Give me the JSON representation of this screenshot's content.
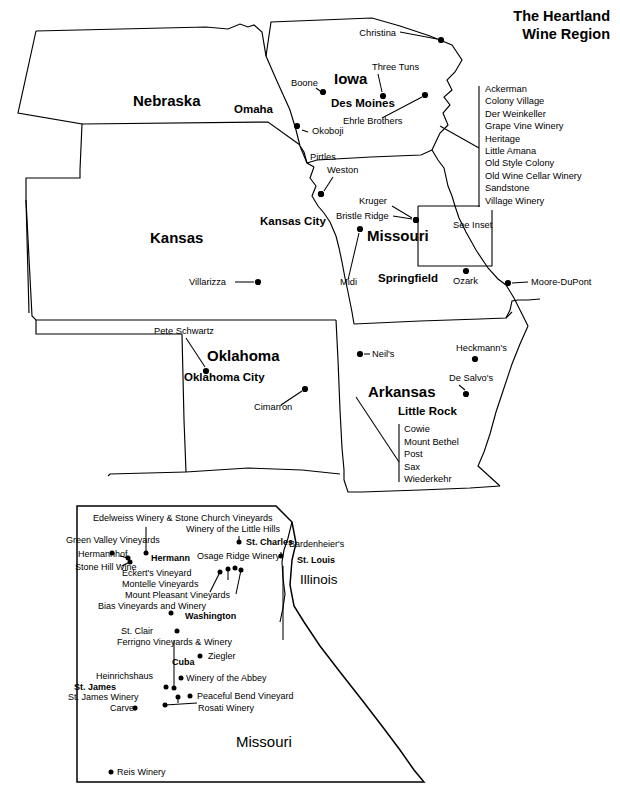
{
  "title": {
    "line1": "The Heartland",
    "line2": "Wine Region"
  },
  "main_map": {
    "states": [
      {
        "name": "Nebraska",
        "x": 133,
        "y": 106
      },
      {
        "name": "Iowa",
        "x": 334,
        "y": 84
      },
      {
        "name": "Kansas",
        "x": 150,
        "y": 243
      },
      {
        "name": "Missouri",
        "x": 367,
        "y": 241
      },
      {
        "name": "Oklahoma",
        "x": 207,
        "y": 361
      },
      {
        "name": "Arkansas",
        "x": 368,
        "y": 397
      }
    ],
    "cities": [
      {
        "name": "Omaha",
        "x": 234,
        "y": 113,
        "anchor": "start"
      },
      {
        "name": "Des Moines",
        "x": 331,
        "y": 107,
        "anchor": "start"
      },
      {
        "name": "Kansas City",
        "x": 260,
        "y": 225,
        "anchor": "start"
      },
      {
        "name": "Springfield",
        "x": 378,
        "y": 282,
        "anchor": "start"
      },
      {
        "name": "Oklahoma City",
        "x": 184,
        "y": 381,
        "anchor": "start"
      },
      {
        "name": "Little Rock",
        "x": 398,
        "y": 415,
        "anchor": "start"
      }
    ],
    "wineries": [
      {
        "name": "Christina",
        "label_x": 396,
        "label_y": 36,
        "anchor": "end",
        "dot_x": 441,
        "dot_y": 40,
        "leader": [
          [
            400,
            32
          ],
          [
            437,
            39
          ]
        ]
      },
      {
        "name": "Three Tuns",
        "label_x": 372,
        "label_y": 70,
        "anchor": "start",
        "dot_x": 383,
        "dot_y": 96,
        "leader": [
          [
            378,
            74
          ],
          [
            382,
            92
          ]
        ]
      },
      {
        "name": "Boone",
        "label_x": 291,
        "label_y": 86,
        "anchor": "start",
        "dot_x": 323,
        "dot_y": 92,
        "leader": [
          [
            316,
            88
          ],
          [
            320,
            91
          ]
        ]
      },
      {
        "name": "Ehrle Brothers",
        "label_x": 343,
        "label_y": 124,
        "anchor": "start",
        "dot_x": 425,
        "dot_y": 95,
        "leader": [
          [
            382,
            118
          ],
          [
            422,
            97
          ]
        ]
      },
      {
        "name": "Okoboji",
        "label_x": 312,
        "label_y": 134,
        "anchor": "start",
        "dot_x": 297,
        "dot_y": 126,
        "leader": [
          [
            302,
            130
          ],
          [
            308,
            132
          ]
        ]
      },
      {
        "name": "Pirtles",
        "label_x": 310,
        "label_y": 160,
        "anchor": "start",
        "dot_x": 321,
        "dot_y": 194,
        "leader": null
      },
      {
        "name": "Weston",
        "label_x": 327,
        "label_y": 173,
        "anchor": "start",
        "dot_x": 321,
        "dot_y": 194,
        "leader": [
          [
            333,
            177
          ],
          [
            324,
            191
          ]
        ]
      },
      {
        "name": "Kruger",
        "label_x": 359,
        "label_y": 204,
        "anchor": "start",
        "dot_x": 416,
        "dot_y": 220,
        "leader": [
          [
            392,
            206
          ],
          [
            412,
            218
          ]
        ]
      },
      {
        "name": "Bristle Ridge",
        "label_x": 336,
        "label_y": 219,
        "anchor": "start",
        "dot_x": 416,
        "dot_y": 220,
        "leader": [
          [
            393,
            216
          ],
          [
            412,
            219
          ]
        ]
      },
      {
        "name": "Midi",
        "label_x": 340,
        "label_y": 285,
        "anchor": "start",
        "dot_x": 360,
        "dot_y": 229,
        "leader": [
          [
            348,
            280
          ],
          [
            359,
            233
          ]
        ]
      },
      {
        "name": "Villarizza",
        "label_x": 189,
        "label_y": 285,
        "anchor": "start",
        "dot_x": 258,
        "dot_y": 282,
        "leader": [
          [
            235,
            282
          ],
          [
            254,
            282
          ]
        ]
      },
      {
        "name": "Ozark",
        "label_x": 453,
        "label_y": 284,
        "anchor": "start",
        "dot_x": 466,
        "dot_y": 271,
        "leader": null
      },
      {
        "name": "Moore-DuPont",
        "label_x": 531,
        "label_y": 285,
        "anchor": "start",
        "dot_x": 508,
        "dot_y": 283,
        "leader": [
          [
            512,
            283
          ],
          [
            528,
            282
          ]
        ]
      },
      {
        "name": "Pete Schwartz",
        "label_x": 154,
        "label_y": 334,
        "anchor": "start",
        "dot_x": 206,
        "dot_y": 371,
        "leader": [
          [
            186,
            338
          ],
          [
            205,
            367
          ]
        ]
      },
      {
        "name": "Neil's",
        "label_x": 372,
        "label_y": 357,
        "anchor": "start",
        "dot_x": 360,
        "dot_y": 354,
        "leader": [
          [
            364,
            354
          ],
          [
            370,
            354
          ]
        ]
      },
      {
        "name": "Heckmann's",
        "label_x": 456,
        "label_y": 351,
        "anchor": "start",
        "dot_x": 475,
        "dot_y": 359,
        "leader": null
      },
      {
        "name": "De Salvo's",
        "label_x": 449,
        "label_y": 381,
        "anchor": "start",
        "dot_x": 466,
        "dot_y": 394,
        "leader": [
          [
            459,
            385
          ],
          [
            465,
            390
          ]
        ]
      },
      {
        "name": "Cimarron",
        "label_x": 254,
        "label_y": 410,
        "anchor": "start",
        "dot_x": 305,
        "dot_y": 389,
        "leader": [
          [
            281,
            405
          ],
          [
            302,
            391
          ]
        ]
      }
    ],
    "see_inset_label": {
      "text": "See Inset",
      "x": 453,
      "y": 228
    },
    "amana_legend": {
      "items": [
        "Ackerman",
        "Colony Village",
        "Der Weinkeller",
        "Grape Vine Winery",
        "Heritage",
        "Little Amana",
        "Old Style Colony",
        "Old Wine Cellar Winery",
        "Sandstone",
        "Village Winery"
      ],
      "x": 485,
      "y_start": 92,
      "line_height": 12.4
    },
    "arkansas_legend": {
      "items": [
        "Cowie",
        "Mount Bethel",
        "Post",
        "Sax",
        "Wiederkehr"
      ],
      "x": 404,
      "y_start": 432,
      "line_height": 12.6
    }
  },
  "inset_map": {
    "states": [
      {
        "name": "Illinois",
        "x": 300,
        "y": 584
      },
      {
        "name": "Missouri",
        "x": 236,
        "y": 747
      }
    ],
    "cities": [
      {
        "name": "Hermann",
        "x": 151,
        "y": 561,
        "anchor": "start"
      },
      {
        "name": "St. Charles",
        "x": 246,
        "y": 545,
        "anchor": "start"
      },
      {
        "name": "St. Louis",
        "x": 297,
        "y": 563,
        "anchor": "start"
      },
      {
        "name": "Washington",
        "x": 185,
        "y": 619,
        "anchor": "start"
      },
      {
        "name": "Cuba",
        "x": 172,
        "y": 665,
        "anchor": "start"
      },
      {
        "name": "St. James",
        "x": 74,
        "y": 690,
        "anchor": "start"
      }
    ],
    "wineries": [
      {
        "name": "Edelweiss Winery & Stone Church Vineyards",
        "label_x": 93,
        "label_y": 521,
        "anchor": "start",
        "dot_x": 146,
        "dot_y": 553
      },
      {
        "name": "Winery of the Little Hills",
        "label_x": 186,
        "label_y": 532,
        "anchor": "start",
        "dot_x": 239,
        "dot_y": 542
      },
      {
        "name": "Green Valley Vineyards",
        "label_x": 66,
        "label_y": 543,
        "anchor": "start",
        "dot_x": 112,
        "dot_y": 553
      },
      {
        "name": "Bardenheier's",
        "label_x": 289,
        "label_y": 547,
        "anchor": "start",
        "dot_x": 281,
        "dot_y": 556
      },
      {
        "name": "Hermannhof",
        "label_x": 78,
        "label_y": 557,
        "anchor": "start",
        "dot_x": 128,
        "dot_y": 558
      },
      {
        "name": "Osage Ridge Winery",
        "label_x": 197,
        "label_y": 559,
        "anchor": "start",
        "dot_x": 235,
        "dot_y": 568
      },
      {
        "name": "Stone Hill Wine",
        "label_x": 75,
        "label_y": 570,
        "anchor": "start",
        "dot_x": 130,
        "dot_y": 562
      },
      {
        "name": "Eckert's Vineyard",
        "label_x": 122,
        "label_y": 576,
        "anchor": "start",
        "dot_x": 228,
        "dot_y": 569
      },
      {
        "name": "Montelle Vineyards",
        "label_x": 122,
        "label_y": 587,
        "anchor": "start",
        "dot_x": 220,
        "dot_y": 572
      },
      {
        "name": "Mount Pleasant Vineyards",
        "label_x": 125,
        "label_y": 598,
        "anchor": "start",
        "dot_x": 241,
        "dot_y": 570
      },
      {
        "name": "Bias Vineyards and Winery",
        "label_x": 98,
        "label_y": 609,
        "anchor": "start",
        "dot_x": 171,
        "dot_y": 613
      },
      {
        "name": "St. Clair",
        "label_x": 121,
        "label_y": 634,
        "anchor": "start",
        "dot_x": 177,
        "dot_y": 631
      },
      {
        "name": "Ferrigno Vineyards & Winery",
        "label_x": 117,
        "label_y": 645,
        "anchor": "start",
        "dot_x": 174,
        "dot_y": 688
      },
      {
        "name": "Ziegler",
        "label_x": 208,
        "label_y": 659,
        "anchor": "start",
        "dot_x": 200,
        "dot_y": 656
      },
      {
        "name": "Heinrichshaus",
        "label_x": 96,
        "label_y": 679,
        "anchor": "start",
        "dot_x": 166,
        "dot_y": 687
      },
      {
        "name": "Winery of the Abbey",
        "label_x": 186,
        "label_y": 681,
        "anchor": "start",
        "dot_x": 181,
        "dot_y": 678
      },
      {
        "name": "St. James Winery",
        "label_x": 68,
        "label_y": 700,
        "anchor": "start",
        "dot_x": 178,
        "dot_y": 697
      },
      {
        "name": "Peaceful Bend Vineyard",
        "label_x": 197,
        "label_y": 699,
        "anchor": "start",
        "dot_x": 190,
        "dot_y": 696
      },
      {
        "name": "Carver",
        "label_x": 110,
        "label_y": 711,
        "anchor": "start",
        "dot_x": 135,
        "dot_y": 708
      },
      {
        "name": "Rosati Winery",
        "label_x": 198,
        "label_y": 711,
        "anchor": "start",
        "dot_x": 165,
        "dot_y": 705
      },
      {
        "name": "Reis Winery",
        "label_x": 117,
        "label_y": 775,
        "anchor": "start",
        "dot_x": 111,
        "dot_y": 772
      }
    ]
  },
  "colors": {
    "ink": "#000000",
    "paper": "#ffffff"
  }
}
